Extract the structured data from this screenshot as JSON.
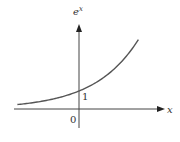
{
  "chart_data": {
    "type": "line",
    "title": "",
    "function": "e^x",
    "xlabel": "x",
    "ylabel": "e^x",
    "xlim": [
      -1.4,
      1.35
    ],
    "ylim": [
      0,
      3.9
    ],
    "grid": false,
    "legend": "none",
    "series": [
      {
        "name": "e^x",
        "x": [
          -1.4,
          -1.2,
          -1.0,
          -0.8,
          -0.6,
          -0.4,
          -0.2,
          0,
          0.2,
          0.4,
          0.6,
          0.8,
          1.0,
          1.2,
          1.35
        ],
        "y": [
          0.247,
          0.301,
          0.368,
          0.449,
          0.549,
          0.67,
          0.819,
          1.0,
          1.221,
          1.492,
          1.822,
          2.226,
          2.718,
          3.32,
          3.857
        ]
      }
    ],
    "annotations": [
      {
        "text": "1",
        "at": "y-intercept"
      },
      {
        "text": "0",
        "at": "origin"
      }
    ],
    "labels": {
      "x_axis": "x",
      "y_axis": "e",
      "y_axis_sup": "x",
      "origin": "0",
      "intercept": "1"
    }
  }
}
